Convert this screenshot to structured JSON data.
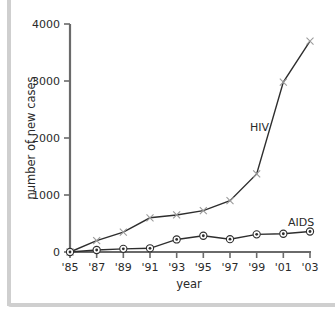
{
  "chart_data": {
    "type": "line",
    "title": "",
    "xlabel": "year",
    "ylabel": "number of new cases",
    "categories": [
      "'85",
      "'87",
      "'89",
      "'91",
      "'93",
      "'95",
      "'97",
      "'99",
      "'01",
      "'03"
    ],
    "x": [
      1985,
      1987,
      1989,
      1991,
      1993,
      1995,
      1997,
      1999,
      2001,
      2003
    ],
    "yticks": [
      0,
      1000,
      2000,
      3000,
      4000
    ],
    "ylim": [
      0,
      4000
    ],
    "grid": false,
    "legend": "inline labels",
    "series": [
      {
        "name": "HIV",
        "marker": "cross",
        "values": [
          0,
          200,
          350,
          600,
          650,
          725,
          900,
          1370,
          2980,
          3700
        ]
      },
      {
        "name": "AIDS",
        "marker": "circle-dot",
        "values": [
          0,
          35,
          55,
          65,
          220,
          285,
          225,
          310,
          320,
          360
        ]
      }
    ]
  },
  "colors": {
    "axis": "#6a6a6a",
    "line": "#2e2e2e",
    "cross_marker": "#9a9a9a",
    "frame": "#cfcfcf",
    "text": "#2a2a2a"
  }
}
